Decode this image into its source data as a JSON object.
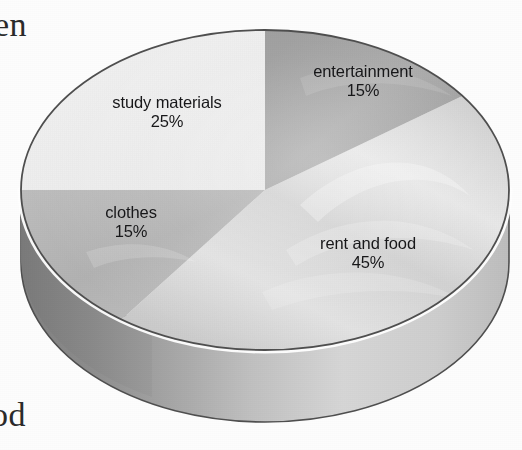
{
  "figure": {
    "kind": "3d-pie-chart",
    "background_color": "#fdfdfd",
    "outline_color": "#4a4a4a",
    "rim_highlight_color": "#ffffff"
  },
  "page_bleed": {
    "top_fragment": "en",
    "bottom_fragment": "od"
  },
  "chart_data": {
    "type": "pie",
    "title": "",
    "subtitle": "",
    "xlabel": "",
    "ylabel": "",
    "legend_position": "none",
    "grid": false,
    "three_d": true,
    "labels_on_slices": true,
    "categories": [
      "entertainment",
      "rent and food",
      "clothes",
      "study materials"
    ],
    "values": [
      15,
      45,
      15,
      25
    ],
    "value_suffix": "%",
    "total": 100,
    "slices": [
      {
        "label": "entertainment",
        "value": 15,
        "value_text": "15%",
        "color": "#9d9d9d",
        "side_color": "#8e8e8e",
        "start_angle_deg": 0,
        "end_angle_deg": 54
      },
      {
        "label": "rent and food",
        "value": 45,
        "value_text": "45%",
        "color": "#d8d8d8",
        "side_color": "#c9c9c9",
        "start_angle_deg": 54,
        "end_angle_deg": 216
      },
      {
        "label": "clothes",
        "value": 15,
        "value_text": "15%",
        "color": "#b4b4b4",
        "side_color": "#939393",
        "start_angle_deg": 216,
        "end_angle_deg": 270
      },
      {
        "label": "study materials",
        "value": 25,
        "value_text": "25%",
        "color": "#efefef",
        "side_color": "#efefef",
        "start_angle_deg": 270,
        "end_angle_deg": 360
      }
    ]
  }
}
